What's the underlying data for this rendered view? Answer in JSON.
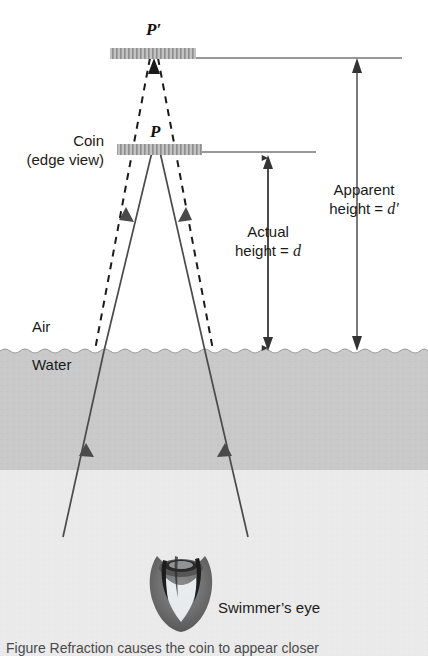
{
  "figure": {
    "points": {
      "image_point": "P′",
      "object_point": "P"
    },
    "labels": {
      "coin_line1": "Coin",
      "coin_line2": "(edge view)",
      "air": "Air",
      "water": "Water",
      "eye": "Swimmer’s eye"
    },
    "dimensions": [
      {
        "name": "actual-height",
        "line1": "Actual",
        "line2_prefix": "height = ",
        "line2_var": "d"
      },
      {
        "name": "apparent-height",
        "line1": "Apparent",
        "line2_prefix": "height = ",
        "line2_var": "d′"
      }
    ],
    "caption": "Figure  Refraction causes the coin to appear closer",
    "colors": {
      "water_fill": "#c9c9c9",
      "ray_stroke": "#4a4a4a",
      "dashed_stroke": "#1a1a1a",
      "coin_bar": "#b4b4b4",
      "reference_line": "#333333",
      "eye_dark": "#6b6b6b",
      "background": "#ffffff"
    }
  }
}
